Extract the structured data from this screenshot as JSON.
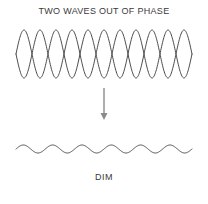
{
  "figure": {
    "title": "TWO WAVES OUT OF PHASE",
    "caption": "DIM",
    "background_color": "#ffffff",
    "wave_color": "#4a4a4a",
    "arrow_color": "#8a8a8a",
    "text_color": "#3a3a3a"
  },
  "chart_data": {
    "type": "line",
    "title": "TWO WAVES OUT OF PHASE",
    "xlabel": "",
    "ylabel": "",
    "grid": false,
    "legend": "none",
    "annotations": [
      "TWO WAVES OUT OF PHASE",
      "DIM"
    ],
    "axis_ranges": {
      "x": [
        16,
        192
      ],
      "y_input_waves": [
        30,
        78
      ],
      "y_result_wave": [
        141,
        157
      ]
    },
    "series": [
      {
        "name": "wave-a",
        "group": "input",
        "amplitude": 24,
        "cycles": 5.5,
        "phase_deg": 0,
        "baseline_y": 54,
        "x_start": 16,
        "x_end": 192
      },
      {
        "name": "wave-b",
        "group": "input",
        "amplitude": 24,
        "cycles": 5.5,
        "phase_deg": 180,
        "baseline_y": 54,
        "x_start": 16,
        "x_end": 192
      },
      {
        "name": "resultant-wave",
        "group": "output",
        "amplitude": 4,
        "cycles": 6,
        "phase_deg": 0,
        "baseline_y": 149,
        "x_start": 16,
        "x_end": 192
      }
    ]
  },
  "arrow": {
    "label": "leads-to",
    "x": 104,
    "y_start": 88,
    "y_end": 120
  }
}
